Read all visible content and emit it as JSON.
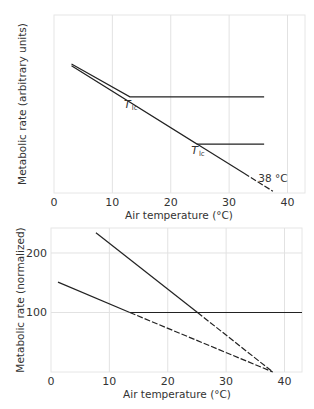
{
  "chart_data": [
    {
      "type": "line",
      "title": "",
      "xlabel": "Air temperature (°C)",
      "ylabel": "Metabolic rate (arbitrary units)",
      "xlim": [
        0,
        43
      ],
      "ylim": [
        0,
        100
      ],
      "x_ticks": [
        0,
        10,
        20,
        30,
        40
      ],
      "y_ticks": [],
      "grid": true,
      "series": [
        {
          "name": "animal-1",
          "points": [
            [
              3,
              72.5
            ],
            [
              13,
              54
            ],
            [
              36,
              54
            ]
          ],
          "style": "solid"
        },
        {
          "name": "animal-2",
          "points": [
            [
              3,
              71.5
            ],
            [
              24.5,
              27.5
            ],
            [
              36,
              27.5
            ]
          ],
          "style": "solid"
        },
        {
          "name": "animal-2-extrapolation",
          "points": [
            [
              24.5,
              27.5
            ],
            [
              37.5,
              1
            ]
          ],
          "style": "dashed-end"
        }
      ],
      "annotations": [
        {
          "text": "T",
          "sub": "lc",
          "x": 12,
          "y": 48
        },
        {
          "text": "T",
          "sub": "lc",
          "x": 23.5,
          "y": 22
        },
        {
          "text": "38 °C",
          "x": 35,
          "y": 6
        }
      ]
    },
    {
      "type": "line",
      "title": "",
      "xlabel": "Air temperature (°C)",
      "ylabel": "Metabolic rate (normalized)",
      "xlim": [
        0,
        43
      ],
      "ylim": [
        0,
        242
      ],
      "x_ticks": [
        0,
        10,
        20,
        30,
        40
      ],
      "y_ticks": [
        100,
        200
      ],
      "grid": true,
      "series": [
        {
          "name": "basal-line",
          "points": [
            [
              13.5,
              100
            ],
            [
              43,
              100
            ]
          ],
          "style": "solid"
        },
        {
          "name": "steep-solid",
          "points": [
            [
              7.7,
              234
            ],
            [
              25.1,
              100
            ]
          ],
          "style": "solid"
        },
        {
          "name": "steep-extrapolation",
          "points": [
            [
              25.1,
              100
            ],
            [
              38,
              0
            ]
          ],
          "style": "dashed"
        },
        {
          "name": "shallow-solid",
          "points": [
            [
              1.2,
              151
            ],
            [
              13.5,
              100
            ]
          ],
          "style": "solid"
        },
        {
          "name": "shallow-extrapolation",
          "points": [
            [
              13.5,
              100
            ],
            [
              38,
              0
            ]
          ],
          "style": "dashed"
        }
      ],
      "annotations": []
    }
  ]
}
